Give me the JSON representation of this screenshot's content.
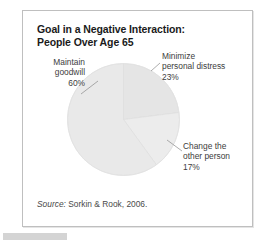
{
  "chart_data": {
    "type": "pie",
    "title": "Goal in a Negative Interaction: People Over Age 65",
    "title_line1": "Goal in a Negative Interaction:",
    "title_line2": "People Over Age 65",
    "categories": [
      "Maintain goodwill",
      "Minimize personal distress",
      "Change the other person"
    ],
    "values": [
      60,
      23,
      17
    ],
    "value_labels": [
      "60%",
      "23%",
      "17%"
    ],
    "unit": "%",
    "legend": "none",
    "labels_position": "outside-with-leader-lines",
    "grid": false,
    "slice_colors": [
      "#e9e9e9",
      "#e5e5e5",
      "#ececec"
    ],
    "slice_border_color": "#dcdcdc",
    "source": "Source: Sorkin & Rook, 2006."
  },
  "card": {
    "border_color": "#bfbfbf",
    "background": "#ffffff"
  },
  "labels": {
    "maintain": {
      "line1": "Maintain",
      "line2": "goodwill",
      "line3": "60%"
    },
    "minimize": {
      "line1": "Minimize",
      "line2": "personal distress",
      "line3": "23%"
    },
    "change": {
      "line1": "Change the",
      "line2": "other person",
      "line3": "17%"
    }
  },
  "source": {
    "prefix": "Source:",
    "text": "Sorkin & Rook, 2006."
  },
  "accent": {
    "text_color": "#3d3d3d",
    "title_color": "#1a1a1a",
    "bar_color": "#d4d4d4"
  }
}
